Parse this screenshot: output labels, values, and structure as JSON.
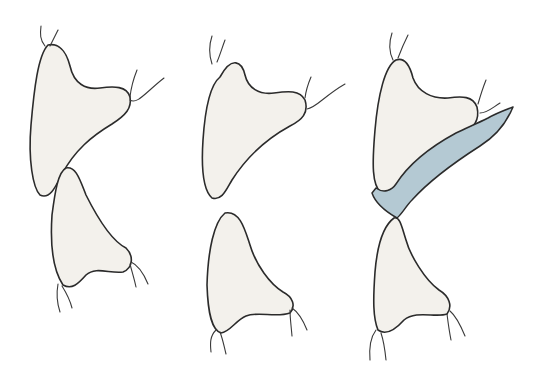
{
  "diagram": {
    "type": "illustration",
    "colors": {
      "background": "#ffffff",
      "tooth_fill": "#f3f1ec",
      "outline": "#2b2b2b",
      "appliance_fill": "#b4c9d3",
      "root_line": "#3a3a3a"
    },
    "panels": [
      {
        "id": "panel-1",
        "description": "upper and lower teeth in contact",
        "teeth": [
          {
            "id": "upper",
            "path": "M48,45 C38,55 34,90 31,125 C28,160 33,188 40,195 C50,200 56,186 62,174 C75,150 92,136 112,124 C126,115 132,108 130,97 C127,86 114,86 100,88 C86,90 74,84 70,66 C66,50 58,43 48,45 Z",
            "roots": [
              "M45,46 C40,40 40,34 41,26",
              "M50,46 C53,40 55,36 58,30",
              "M130,97 C131,88 133,80 137,70",
              "M130,100 C137,105 146,92 164,78"
            ]
          },
          {
            "id": "lower",
            "path": "M66,168 C58,172 55,192 52,215 C50,245 53,270 63,285 C72,290 78,284 86,275 C96,266 110,274 123,272 C133,268 134,256 126,248 C110,240 96,215 86,195 C80,180 76,166 66,168 Z",
            "roots": [
              "M58,284 C56,295 57,303 60,312",
              "M62,286 C67,294 70,300 72,308",
              "M130,264 C132,272 134,278 136,287",
              "M131,262 C138,265 143,272 148,284"
            ]
          }
        ]
      },
      {
        "id": "panel-2",
        "description": "upper and lower teeth separated",
        "teeth": [
          {
            "id": "upper",
            "path": "M220,77 C210,85 205,110 203,140 C201,170 203,190 212,198 C222,201 226,190 232,180 C248,155 268,138 290,126 C302,120 309,113 305,100 C300,90 288,91 274,93 C259,95 248,88 245,75 C242,62 232,55 220,77 Z",
            "roots": [
              "M212,64 C209,55 209,45 212,36",
              "M217,62 C220,55 222,48 225,40",
              "M305,98 C306,90 308,84 311,77",
              "M307,109 C316,108 324,96 345,84"
            ]
          },
          {
            "id": "lower",
            "path": "M225,213 C214,222 208,250 207,285 C208,315 212,330 221,333 C230,332 236,320 246,316 C258,311 276,318 290,313 C296,306 293,297 283,292 C270,284 256,265 250,245 C245,230 240,210 225,213 Z",
            "roots": [
              "M216,330 C210,336 210,343 211,352",
              "M220,332 C223,340 224,346 226,354",
              "M290,310 C290,318 291,324 292,336",
              "M292,308 C298,312 303,320 307,330"
            ]
          }
        ]
      },
      {
        "id": "panel-3",
        "description": "upper and lower teeth with blue appliance on palatal surface of upper tooth",
        "teeth": [
          {
            "id": "upper",
            "path": "M396,60 C385,66 378,95 375,130 C372,165 372,185 381,193 C391,198 397,188 406,176 C418,160 440,146 462,135 C474,128 480,120 477,107 C473,96 462,96 448,98 C432,99 418,92 413,78 C410,66 405,57 396,60 Z",
            "roots": [
              "M393,60 C389,52 389,42 392,33",
              "M398,58 C401,50 404,43 408,35",
              "M478,104 C480,97 482,90 486,80",
              "M480,113 C487,113 492,108 500,103"
            ]
          },
          {
            "id": "lower",
            "path": "M394,218 C383,226 377,248 375,272 C373,300 373,318 378,330 C386,336 395,330 404,320 C416,310 436,318 447,314 C453,306 449,296 439,290 C425,280 410,255 406,240 C402,228 400,216 394,218 Z",
            "roots": [
              "M376,330 C370,338 369,348 370,360",
              "M381,333 C384,342 385,350 386,360",
              "M447,314 C448,322 449,330 451,340",
              "M450,311 C456,316 460,324 465,336"
            ]
          }
        ],
        "appliance": {
          "path": "M372,193 C376,205 390,214 397,218 C402,214 406,206 412,200 C430,180 455,162 480,146 C496,136 506,124 513,107 C505,110 495,114 488,118 C476,124 466,128 456,133 C432,146 410,162 396,184 C392,190 384,194 376,188 Z"
        }
      }
    ]
  }
}
